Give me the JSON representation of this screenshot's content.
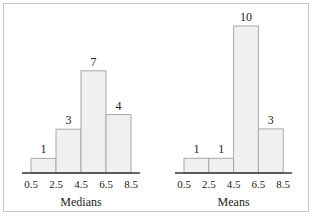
{
  "chart_data": [
    {
      "type": "bar",
      "title": "",
      "xlabel": "Medians",
      "ylabel": "",
      "bin_edges": [
        0.5,
        2.5,
        4.5,
        6.5,
        8.5
      ],
      "tick_labels": [
        "0.5",
        "2.5",
        "4.5",
        "6.5",
        "8.5"
      ],
      "categories": [
        "0.5-2.5",
        "2.5-4.5",
        "4.5-6.5",
        "6.5-8.5"
      ],
      "values": [
        1,
        3,
        7,
        4
      ],
      "data_labels": [
        "1",
        "3",
        "7",
        "4"
      ],
      "grid": false,
      "legend": null
    },
    {
      "type": "bar",
      "title": "",
      "xlabel": "Means",
      "ylabel": "",
      "bin_edges": [
        0.5,
        2.5,
        4.5,
        6.5,
        8.5
      ],
      "tick_labels": [
        "0.5",
        "2.5",
        "4.5",
        "6.5",
        "8.5"
      ],
      "categories": [
        "0.5-2.5",
        "2.5-4.5",
        "4.5-6.5",
        "6.5-8.5"
      ],
      "values": [
        1,
        1,
        10,
        3
      ],
      "data_labels": [
        "1",
        "1",
        "10",
        "3"
      ],
      "grid": false,
      "legend": null
    }
  ],
  "colors": {
    "bar_fill": "#f0f0f0",
    "bar_stroke": "#a8a8a8",
    "axis": "#333333",
    "frame": "#c8c8c8"
  }
}
